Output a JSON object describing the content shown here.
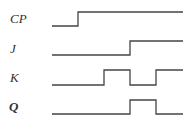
{
  "diagram": {
    "type": "timing-diagram",
    "signals": [
      {
        "name": "CP",
        "label": "CP",
        "label_y": 23,
        "low_y": 26,
        "high_y": 12,
        "points": "52,26 78,26 78,12 183,12"
      },
      {
        "name": "J",
        "label": "J",
        "label_y": 53,
        "low_y": 55,
        "high_y": 41,
        "points": "52,55 130,55 130,41 183,41"
      },
      {
        "name": "K",
        "label": "K",
        "label_y": 82,
        "low_y": 85,
        "high_y": 70,
        "points": "52,85 104,85 104,70 130,70 130,85 156,85 156,70 183,70"
      },
      {
        "name": "Q",
        "label": "Q",
        "label_y": 111,
        "low_y": 114,
        "high_y": 100,
        "points": "52,114 130,114 130,100 156,100 156,114 183,114"
      }
    ],
    "stroke_color": "#444444"
  }
}
